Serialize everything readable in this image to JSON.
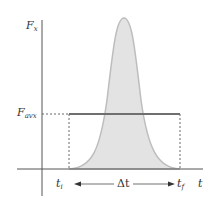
{
  "diagram": {
    "y_axis_label": "F",
    "y_axis_label_sub": "x",
    "x_axis_label": "t",
    "avg_force_label": "F",
    "avg_force_label_sub": "avx",
    "t_initial_label": "t",
    "t_initial_sub": "i",
    "t_final_label": "t",
    "t_final_sub": "f",
    "delta_t_label": "Δt",
    "colors": {
      "curve_fill": "#e3e3e3",
      "curve_stroke": "#bdbdbd",
      "avg_line": "#6f6f6f",
      "axis": "#555555"
    }
  }
}
